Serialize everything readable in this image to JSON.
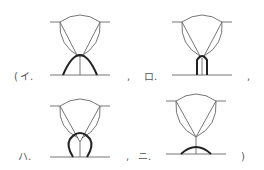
{
  "figure": {
    "open_paren": "(",
    "close_paren": ")",
    "separator": ",",
    "options": [
      {
        "key": "a",
        "label": "イ.",
        "description": "parabolic bold arc spanning beneath weld root"
      },
      {
        "key": "b",
        "label": "ロ.",
        "description": "narrow vertical U-shaped bold profile at root"
      },
      {
        "key": "c",
        "label": "ハ.",
        "description": "bulb / keyhole shaped bold profile at root"
      },
      {
        "key": "d",
        "label": "ニ.",
        "description": "shallow bold arc on base line beneath root"
      }
    ]
  },
  "colors": {
    "line": "#666666",
    "bold": "#222222",
    "text": "#555555"
  }
}
